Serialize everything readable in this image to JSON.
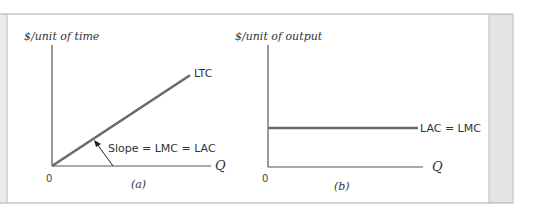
{
  "chart_data": [
    {
      "type": "line",
      "panel_label": "(a)",
      "ylabel": "$/unit of time",
      "xlabel": "Q",
      "origin_label": "0",
      "series": [
        {
          "name": "LTC",
          "label": "LTC",
          "x": [
            0,
            1
          ],
          "y": [
            0,
            0.75
          ],
          "description": "straight ray from origin"
        }
      ],
      "annotations": [
        {
          "text": "Slope = LMC = LAC",
          "arrow_to": "LTC"
        }
      ],
      "grid": false
    },
    {
      "type": "line",
      "panel_label": "(b)",
      "ylabel": "$/unit of output",
      "xlabel": "Q",
      "origin_label": "0",
      "series": [
        {
          "name": "LAC = LMC",
          "label": "LAC = LMC",
          "x": [
            0,
            1
          ],
          "y": [
            0.33,
            0.33
          ],
          "description": "horizontal line"
        }
      ],
      "grid": false
    }
  ],
  "colors": {
    "curve": "#6a6a6a",
    "axis": "#555555",
    "frame_side": "#e6e6e6"
  }
}
